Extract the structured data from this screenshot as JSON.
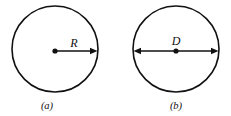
{
  "figure": {
    "background_color": "#ffffff",
    "line_color": "#111111",
    "width": 231,
    "height": 116,
    "panels": [
      {
        "id": "panel-a",
        "caption": "(a)",
        "caption_x": 47,
        "caption_y": 109,
        "circle": {
          "center_x": 55,
          "center_y": 49,
          "radius": 43
        },
        "measure": {
          "name": "radius",
          "label": "R",
          "label_x": 74,
          "label_y": 47,
          "arrow_type": "single",
          "x_start": 55,
          "x_end": 97,
          "y": 51
        },
        "center_dot": {
          "x": 55,
          "y": 51,
          "r": 2.6
        }
      },
      {
        "id": "panel-b",
        "caption": "(b)",
        "caption_x": 176,
        "caption_y": 109,
        "circle": {
          "center_x": 176,
          "center_y": 49,
          "radius": 43
        },
        "measure": {
          "name": "diameter",
          "label": "D",
          "label_x": 176,
          "label_y": 45,
          "arrow_type": "double",
          "x_start": 134,
          "x_end": 218,
          "y": 51
        },
        "center_dot": {
          "x": 176,
          "y": 51,
          "r": 2.6
        }
      }
    ]
  }
}
